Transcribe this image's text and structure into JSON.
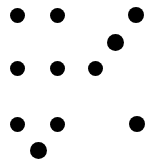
{
  "canvas": {
    "width": 160,
    "height": 160,
    "background_color": "#ffffff",
    "dot_color": "#000000",
    "dot_count": 10
  },
  "chart_data": {
    "type": "scatter",
    "title": "",
    "subtitle": "",
    "xlabel": "",
    "ylabel": "",
    "xlim": [
      0,
      160
    ],
    "ylim": [
      0,
      160
    ],
    "grid": false,
    "legend": null,
    "marker": "circle",
    "marker_color": "#000000",
    "background_color": "#ffffff",
    "points": [
      {
        "id": "dot-1",
        "x": 17,
        "y": 15,
        "d": 15
      },
      {
        "id": "dot-2",
        "x": 57,
        "y": 15,
        "d": 15
      },
      {
        "id": "dot-3",
        "x": 136,
        "y": 15,
        "d": 16
      },
      {
        "id": "dot-4",
        "x": 115,
        "y": 42,
        "d": 17
      },
      {
        "id": "dot-5",
        "x": 17,
        "y": 68,
        "d": 15
      },
      {
        "id": "dot-6",
        "x": 57,
        "y": 68,
        "d": 15
      },
      {
        "id": "dot-7",
        "x": 95,
        "y": 68,
        "d": 15
      },
      {
        "id": "dot-8",
        "x": 17,
        "y": 124,
        "d": 15
      },
      {
        "id": "dot-9",
        "x": 57,
        "y": 124,
        "d": 15
      },
      {
        "id": "dot-10",
        "x": 137,
        "y": 124,
        "d": 16
      },
      {
        "id": "dot-11",
        "x": 38,
        "y": 150,
        "d": 17
      }
    ]
  }
}
